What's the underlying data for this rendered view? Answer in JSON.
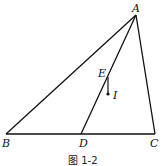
{
  "figure": {
    "caption": "图 1-2",
    "stroke_color": "#111111",
    "points": {
      "A": {
        "label": "A",
        "x": 136,
        "y": 15
      },
      "B": {
        "label": "B",
        "x": 6,
        "y": 134
      },
      "C": {
        "label": "C",
        "x": 155,
        "y": 134
      },
      "D": {
        "label": "D",
        "x": 81,
        "y": 134
      },
      "E": {
        "label": "E",
        "x": 108,
        "y": 77
      },
      "I": {
        "label": "I",
        "x": 109,
        "y": 94
      }
    },
    "segments": [
      "AB",
      "AC",
      "BC",
      "AD",
      "EI"
    ]
  }
}
